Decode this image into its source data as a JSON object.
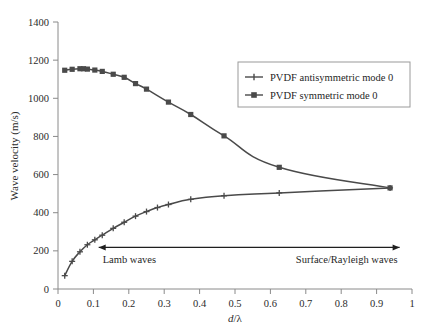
{
  "chart_data": {
    "type": "line",
    "title": "",
    "xlabel": "d/λ",
    "ylabel": "Wave velocity (m/s)",
    "xlim": [
      0,
      1
    ],
    "ylim": [
      0,
      1400
    ],
    "xticks": [
      "0",
      "0.1",
      "0.2",
      "0.3",
      "0.4",
      "0.5",
      "0.6",
      "0.7",
      "0.8",
      "0.9",
      "1"
    ],
    "xtick_values": [
      0,
      0.1,
      0.2,
      0.3,
      0.4,
      0.5,
      0.6,
      0.7,
      0.8,
      0.9,
      1
    ],
    "yticks": [
      "0",
      "200",
      "400",
      "600",
      "800",
      "1000",
      "1200",
      "1400"
    ],
    "ytick_values": [
      0,
      200,
      400,
      600,
      800,
      1000,
      1200,
      1400
    ],
    "grid": false,
    "legend_position": "upper-right",
    "series": [
      {
        "name": "PVDF antisymmetric mode 0",
        "marker": "plus",
        "color": "#4a4a4a",
        "x": [
          0.019,
          0.04,
          0.062,
          0.083,
          0.104,
          0.125,
          0.156,
          0.187,
          0.219,
          0.25,
          0.281,
          0.312,
          0.375,
          0.469,
          0.625,
          0.938
        ],
        "y": [
          70,
          145,
          195,
          232,
          258,
          282,
          318,
          350,
          382,
          406,
          427,
          443,
          470,
          489,
          504,
          530
        ]
      },
      {
        "name": "PVDF symmetric mode 0",
        "marker": "square",
        "color": "#4a4a4a",
        "x": [
          0.019,
          0.04,
          0.062,
          0.072,
          0.083,
          0.104,
          0.125,
          0.156,
          0.187,
          0.219,
          0.25,
          0.312,
          0.375,
          0.469,
          0.625,
          0.938
        ],
        "y": [
          1147,
          1152,
          1155,
          1155,
          1153,
          1148,
          1141,
          1126,
          1110,
          1077,
          1048,
          980,
          915,
          803,
          638,
          530
        ]
      }
    ],
    "annotations": [
      {
        "name": "wave-regime-arrow",
        "type": "double-arrow",
        "x_start": 0.115,
        "x_end": 0.965,
        "y": 218,
        "left_label": "Lamb waves",
        "right_label": "Surface/Rayleigh waves"
      }
    ]
  },
  "legend": {
    "entries": [
      {
        "label": "PVDF antisymmetric mode 0",
        "marker": "plus"
      },
      {
        "label": "PVDF symmetric mode 0",
        "marker": "square"
      }
    ]
  },
  "colors": {
    "line": "#4a4a4a",
    "axis": "#8a8a8a",
    "text": "#1f1f1f",
    "background": "#ffffff"
  }
}
